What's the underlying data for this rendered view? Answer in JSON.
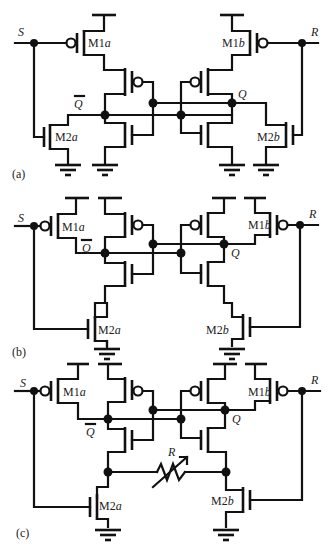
{
  "figure": {
    "panels": [
      {
        "id": "a",
        "caption": "(a)",
        "inputs": {
          "set": "S",
          "reset": "R"
        },
        "nodes": {
          "q_bar": "Q",
          "q": "Q"
        },
        "transistors": {
          "m1a": {
            "name": "M1",
            "suffix": "a",
            "type": "pmos"
          },
          "m1b": {
            "name": "M1",
            "suffix": "b",
            "type": "pmos"
          },
          "m2a": {
            "name": "M2",
            "suffix": "a",
            "type": "nmos"
          },
          "m2b": {
            "name": "M2",
            "suffix": "b",
            "type": "nmos"
          }
        },
        "topology": "M1a/M1b pull-up in series with inverter pMOS; M2a/M2b pull-down in parallel with inverter nMOS"
      },
      {
        "id": "b",
        "caption": "(b)",
        "inputs": {
          "set": "S",
          "reset": "R"
        },
        "nodes": {
          "q_bar": "Q",
          "q": "Q"
        },
        "transistors": {
          "m1a": {
            "name": "M1",
            "suffix": "a",
            "type": "pmos"
          },
          "m1b": {
            "name": "M1",
            "suffix": "b",
            "type": "pmos"
          },
          "m2a": {
            "name": "M2",
            "suffix": "a",
            "type": "nmos"
          },
          "m2b": {
            "name": "M2",
            "suffix": "b",
            "type": "nmos"
          }
        },
        "topology": "M1a/M1b pull-up in parallel with inverter pMOS; M2a/M2b in series with inverter nMOS to ground"
      },
      {
        "id": "c",
        "caption": "(c)",
        "inputs": {
          "set": "S",
          "reset": "R"
        },
        "nodes": {
          "q_bar": "Q",
          "q": "Q"
        },
        "resistor": {
          "label": "R",
          "type": "variable"
        },
        "transistors": {
          "m1a": {
            "name": "M1",
            "suffix": "a",
            "type": "pmos"
          },
          "m1b": {
            "name": "M1",
            "suffix": "b",
            "type": "pmos"
          },
          "m2a": {
            "name": "M2",
            "suffix": "a",
            "type": "nmos"
          },
          "m2b": {
            "name": "M2",
            "suffix": "b",
            "type": "nmos"
          }
        },
        "topology": "Same as (b) with a variable resistor R connecting the internal series nodes of the two pull-down stacks"
      }
    ]
  }
}
